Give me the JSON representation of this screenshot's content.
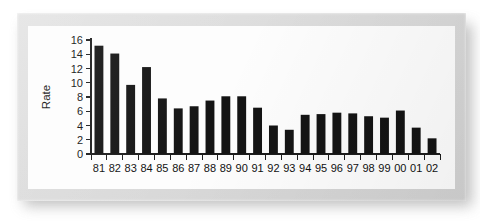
{
  "figure": {
    "kind": "scanned-bar-chart-figure"
  },
  "chart_data": {
    "type": "bar",
    "title": "",
    "subtitle": "",
    "xlabel": "",
    "ylabel": "Rate",
    "categories": [
      "81",
      "82",
      "83",
      "84",
      "85",
      "86",
      "87",
      "88",
      "89",
      "90",
      "91",
      "92",
      "93",
      "94",
      "95",
      "96",
      "97",
      "98",
      "99",
      "00",
      "01",
      "02"
    ],
    "values": [
      15.2,
      14.1,
      9.7,
      12.2,
      7.8,
      6.4,
      6.7,
      7.5,
      8.1,
      8.1,
      6.5,
      4.0,
      3.4,
      5.5,
      5.6,
      5.8,
      5.7,
      5.3,
      5.1,
      6.1,
      3.7,
      2.2
    ],
    "ylim": [
      0,
      16
    ],
    "yticks": [
      0,
      2,
      4,
      6,
      8,
      10,
      12,
      14,
      16
    ],
    "ytick_labels": [
      "0",
      "2",
      "4",
      "6",
      "8",
      "10",
      "12",
      "14",
      "16"
    ],
    "xtick_labels": [
      "81",
      "82",
      "83",
      "84",
      "85",
      "86",
      "87",
      "88",
      "89",
      "90",
      "91",
      "92",
      "93",
      "94",
      "95",
      "96",
      "97",
      "98",
      "99",
      "00",
      "01",
      "02"
    ],
    "grid": false,
    "legend": null,
    "legend_position": "none",
    "bar_color": "#141414",
    "axis_color": "#1c1c1c",
    "background_color": "#fdfdfd",
    "annotations": []
  }
}
